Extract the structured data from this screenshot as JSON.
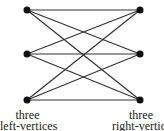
{
  "diagram": {
    "type": "complete-bipartite-graph-K3,3",
    "left_vertices": [
      {
        "id": "L1",
        "x": 27,
        "y": 10
      },
      {
        "id": "L2",
        "x": 27,
        "y": 54
      },
      {
        "id": "L3",
        "x": 27,
        "y": 100
      }
    ],
    "right_vertices": [
      {
        "id": "R1",
        "x": 140,
        "y": 10
      },
      {
        "id": "R2",
        "x": 140,
        "y": 54
      },
      {
        "id": "R3",
        "x": 140,
        "y": 100
      }
    ],
    "edge_color": "#333333",
    "vertex_color": "#111111"
  },
  "labels": {
    "left_line1": "three",
    "left_line2": "left-vertices",
    "right_line1": "three",
    "right_line2": "right-vertice"
  }
}
